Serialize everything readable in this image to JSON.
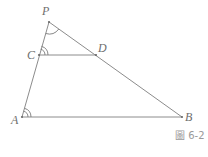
{
  "figure": {
    "caption": "圖 6-2",
    "colors": {
      "line": "#8c8c8c",
      "label": "#6e6e6e",
      "caption": "#9a9a9a",
      "background": "#ffffff"
    },
    "points": {
      "P": {
        "label": "P",
        "x": 49,
        "y": 22
      },
      "C": {
        "label": "C",
        "x": 39,
        "y": 55
      },
      "D": {
        "label": "D",
        "x": 96,
        "y": 55
      },
      "A": {
        "label": "A",
        "x": 22,
        "y": 117
      },
      "B": {
        "label": "B",
        "x": 182,
        "y": 117
      }
    },
    "segments": [
      "PA",
      "PB",
      "CD",
      "AB"
    ],
    "angle_marks": [
      {
        "vertex": "P",
        "between": [
          "A",
          "B"
        ],
        "arcs": 1
      },
      {
        "vertex": "C",
        "between": [
          "P",
          "D"
        ],
        "arcs": 2
      },
      {
        "vertex": "A",
        "between": [
          "P",
          "B"
        ],
        "arcs": 2
      }
    ]
  }
}
